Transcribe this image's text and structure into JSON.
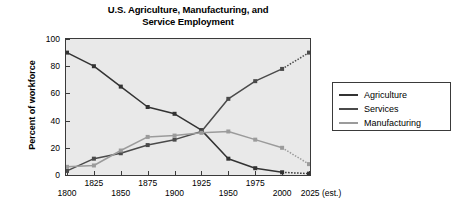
{
  "chart_data": {
    "type": "line",
    "title": "U.S. Agriculture, Manufacturing, and Service Employment",
    "title_line1": "U.S. Agriculture, Manufacturing, and",
    "title_line2": "Service Employment",
    "xlabel": "",
    "ylabel": "Percent of workforce",
    "x": [
      1800,
      1825,
      1850,
      1875,
      1900,
      1925,
      1950,
      1975,
      2000,
      2025
    ],
    "xtick_labels": [
      "1800",
      "1825",
      "1850",
      "1875",
      "1900",
      "1925",
      "1950",
      "1975",
      "2000",
      "2025 (est.)"
    ],
    "ytick_labels": [
      "0",
      "20",
      "40",
      "60",
      "80",
      "100"
    ],
    "yticks": [
      0,
      20,
      40,
      60,
      80,
      100
    ],
    "ylim": [
      0,
      100
    ],
    "xlim": [
      1800,
      2025
    ],
    "grid": false,
    "legend_position": "right-outside",
    "estimate_from": 2000,
    "estimate_note": "(est.)",
    "series": [
      {
        "name": "Agriculture",
        "color": "#333333",
        "values": [
          90,
          80,
          65,
          50,
          45,
          33,
          12,
          5,
          2,
          1
        ]
      },
      {
        "name": "Services",
        "color": "#4a4a4a",
        "values": [
          3,
          12,
          16,
          22,
          26,
          32,
          56,
          69,
          78,
          90
        ]
      },
      {
        "name": "Manufacturing",
        "color": "#9b9b9b",
        "values": [
          6,
          7,
          18,
          28,
          29,
          31,
          32,
          26,
          20,
          8
        ]
      }
    ]
  },
  "legend": {
    "items": [
      {
        "label": "Agriculture",
        "color": "#333333"
      },
      {
        "label": "Services",
        "color": "#4a4a4a"
      },
      {
        "label": "Manufacturing",
        "color": "#9b9b9b"
      }
    ]
  },
  "colors": {
    "plot_background": "#e9e9e9",
    "frame": "#3a3a3a",
    "page_background": "#ffffff",
    "text": "#000000"
  }
}
